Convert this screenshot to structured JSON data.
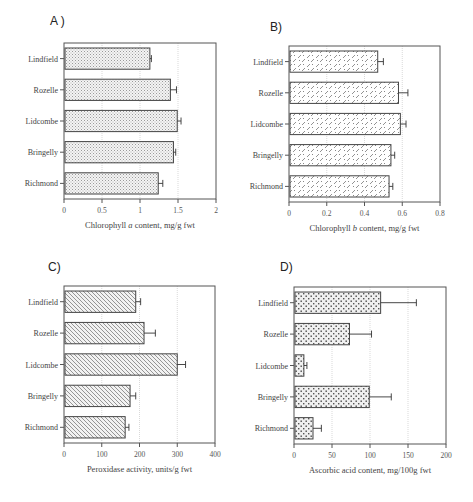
{
  "chart_data": [
    {
      "id": "A",
      "panel_label": "A )",
      "type": "bar",
      "orientation": "horizontal",
      "categories": [
        "Lindfield",
        "Rozelle",
        "Lidcombe",
        "Bringelly",
        "Richmond"
      ],
      "values": [
        1.13,
        1.4,
        1.49,
        1.44,
        1.24
      ],
      "error_upper": [
        1.15,
        1.48,
        1.54,
        1.47,
        1.3
      ],
      "xlabel_parts": [
        "Chlorophyll ",
        "a",
        " content, mg/g fwt"
      ],
      "xlabel": "Chlorophyll a content, mg/g fwt",
      "ylabel": "",
      "xlim": [
        0,
        2
      ],
      "xticks": [
        0,
        0.5,
        1,
        1.5,
        2
      ],
      "xtick_labels": [
        "0",
        "0.5",
        "1",
        "1.5",
        "2"
      ],
      "grid": "vertical dotted",
      "pattern": "fine-dots",
      "box": {
        "x": 64,
        "y": 43,
        "w": 152,
        "h": 156
      },
      "letter_pos": {
        "x": 50,
        "y": 14
      }
    },
    {
      "id": "B",
      "panel_label": "B)",
      "type": "bar",
      "orientation": "horizontal",
      "categories": [
        "Lindfield",
        "Rozelle",
        "Lidcombe",
        "Bringelly",
        "Richmond"
      ],
      "values": [
        0.47,
        0.58,
        0.59,
        0.54,
        0.53
      ],
      "error_upper": [
        0.5,
        0.63,
        0.62,
        0.56,
        0.55
      ],
      "xlabel_parts": [
        "Chlorophyll ",
        "b",
        " content, mg/g fwt"
      ],
      "xlabel": "Chlorophyll b content, mg/g fwt",
      "ylabel": "",
      "xlim": [
        0,
        0.8
      ],
      "xticks": [
        0,
        0.2,
        0.4,
        0.6,
        0.8
      ],
      "xtick_labels": [
        "0",
        "0.2",
        "0.4",
        "0.6",
        "0.8"
      ],
      "grid": "vertical dotted",
      "pattern": "diagonal-dashes",
      "box": {
        "x": 289,
        "y": 46,
        "w": 151,
        "h": 156
      },
      "letter_pos": {
        "x": 270,
        "y": 20
      }
    },
    {
      "id": "C",
      "panel_label": "C)",
      "type": "bar",
      "orientation": "horizontal",
      "categories": [
        "Lindfield",
        "Rozelle",
        "Lidcombe",
        "Bringelly",
        "Richmond"
      ],
      "values": [
        190,
        212,
        300,
        175,
        162
      ],
      "error_upper": [
        203,
        242,
        322,
        190,
        172
      ],
      "xlabel_parts": [
        "Peroxidase activity, units/g fwt"
      ],
      "xlabel": "Peroxidase activity, units/g fwt",
      "ylabel": "",
      "xlim": [
        0,
        400
      ],
      "xticks": [
        0,
        100,
        200,
        300,
        400
      ],
      "xtick_labels": [
        "0",
        "100",
        "200",
        "300",
        "400"
      ],
      "grid": "vertical dotted",
      "pattern": "diagonal-hatch",
      "box": {
        "x": 64,
        "y": 286,
        "w": 151,
        "h": 157
      },
      "letter_pos": {
        "x": 48,
        "y": 260
      }
    },
    {
      "id": "D",
      "panel_label": "D)",
      "type": "bar",
      "orientation": "horizontal",
      "categories": [
        "Lindfield",
        "Rozelle",
        "Lidcombe",
        "Bringelly",
        "Richmond"
      ],
      "values": [
        114,
        73,
        13,
        99,
        25
      ],
      "error_upper": [
        161,
        102,
        17,
        128,
        36
      ],
      "xlabel_parts": [
        "Ascorbic acid content, mg/100g fwt"
      ],
      "xlabel": "Ascorbic acid content, mg/100g fwt",
      "ylabel": "",
      "xlim": [
        0,
        200
      ],
      "xticks": [
        0,
        50,
        100,
        150,
        200
      ],
      "xtick_labels": [
        "0",
        "50",
        "100",
        "150",
        "200"
      ],
      "grid": "vertical dotted",
      "pattern": "coarse-dots",
      "box": {
        "x": 294,
        "y": 287,
        "w": 152,
        "h": 157
      },
      "letter_pos": {
        "x": 280,
        "y": 260
      }
    }
  ],
  "colors": {
    "axis": "#555555",
    "bar_border": "#444444",
    "grid": "#c8c8c8",
    "pattern_ink": "#8a8a8a",
    "background": "#ffffff"
  }
}
